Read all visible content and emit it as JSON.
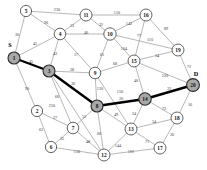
{
  "figure": {
    "kind": "weighted-undirected-graph",
    "background_color": "#ffffff",
    "edge_color": "#9a9a9a",
    "path_color": "#000000",
    "node_fill": "#ffffff",
    "node_stroke": "#3d3d3d",
    "highlight_fill": "#a8a8a8"
  },
  "terminals": [
    {
      "name": "source-marker",
      "text": "S",
      "x": 10,
      "y": 44
    },
    {
      "name": "destination-marker",
      "text": "D",
      "x": 196,
      "y": 73
    }
  ],
  "nodes": [
    {
      "id": "1",
      "label": "1",
      "x": 14,
      "y": 58,
      "r": 6.0,
      "highlighted": true
    },
    {
      "id": "2",
      "label": "2",
      "x": 37,
      "y": 111,
      "r": 5.6,
      "highlighted": false
    },
    {
      "id": "3",
      "label": "3",
      "x": 49,
      "y": 71,
      "r": 6.0,
      "highlighted": true
    },
    {
      "id": "4",
      "label": "4",
      "x": 60,
      "y": 34,
      "r": 5.8,
      "highlighted": false
    },
    {
      "id": "5",
      "label": "5",
      "x": 26,
      "y": 11,
      "r": 5.6,
      "highlighted": false
    },
    {
      "id": "6",
      "label": "6",
      "x": 51,
      "y": 147,
      "r": 5.6,
      "highlighted": false
    },
    {
      "id": "7",
      "label": "7",
      "x": 73,
      "y": 128,
      "r": 5.8,
      "highlighted": false
    },
    {
      "id": "8",
      "label": "8",
      "x": 97,
      "y": 106,
      "r": 6.0,
      "highlighted": true
    },
    {
      "id": "9",
      "label": "9",
      "x": 95,
      "y": 73,
      "r": 5.8,
      "highlighted": false
    },
    {
      "id": "10",
      "label": "10",
      "x": 110,
      "y": 34,
      "r": 6.2,
      "highlighted": false
    },
    {
      "id": "11",
      "label": "11",
      "x": 86,
      "y": 15,
      "r": 6.0,
      "highlighted": false
    },
    {
      "id": "12",
      "label": "12",
      "x": 104,
      "y": 155,
      "r": 6.0,
      "highlighted": false
    },
    {
      "id": "13",
      "label": "13",
      "x": 131,
      "y": 129,
      "r": 6.0,
      "highlighted": false
    },
    {
      "id": "14",
      "label": "14",
      "x": 145,
      "y": 99,
      "r": 6.2,
      "highlighted": true
    },
    {
      "id": "15",
      "label": "15",
      "x": 134,
      "y": 61,
      "r": 6.0,
      "highlighted": false
    },
    {
      "id": "16",
      "label": "16",
      "x": 146,
      "y": 15,
      "r": 6.0,
      "highlighted": false
    },
    {
      "id": "17",
      "label": "17",
      "x": 160,
      "y": 148,
      "r": 6.0,
      "highlighted": false
    },
    {
      "id": "18",
      "label": "18",
      "x": 177,
      "y": 118,
      "r": 6.0,
      "highlighted": false
    },
    {
      "id": "19",
      "label": "19",
      "x": 178,
      "y": 50,
      "r": 6.0,
      "highlighted": false
    },
    {
      "id": "20",
      "label": "20",
      "x": 193,
      "y": 85,
      "r": 6.4,
      "highlighted": true
    }
  ],
  "edges": [
    {
      "from": "5",
      "to": "11",
      "weight": "230",
      "lx": 57,
      "ly": 10,
      "on_path": false
    },
    {
      "from": "5",
      "to": "4",
      "weight": "90",
      "lx": 46,
      "ly": 23,
      "on_path": false
    },
    {
      "from": "5",
      "to": "1",
      "weight": "30",
      "lx": 17,
      "ly": 35,
      "on_path": false
    },
    {
      "from": "11",
      "to": "16",
      "weight": "150",
      "lx": 117,
      "ly": 13,
      "on_path": false
    },
    {
      "from": "11",
      "to": "4",
      "weight": "13",
      "lx": 72,
      "ly": 26,
      "on_path": false
    },
    {
      "from": "11",
      "to": "10",
      "weight": "32",
      "lx": 101,
      "ly": 25,
      "on_path": false
    },
    {
      "from": "4",
      "to": "10",
      "weight": "40",
      "lx": 86,
      "ly": 33,
      "on_path": false
    },
    {
      "from": "4",
      "to": "1",
      "weight": "45",
      "lx": 35,
      "ly": 44,
      "on_path": false
    },
    {
      "from": "4",
      "to": "3",
      "weight": "43",
      "lx": 55,
      "ly": 54,
      "on_path": false
    },
    {
      "from": "4",
      "to": "9",
      "weight": "17",
      "lx": 76,
      "ly": 55,
      "on_path": false
    },
    {
      "from": "10",
      "to": "16",
      "weight": "142",
      "lx": 129,
      "ly": 24,
      "on_path": false
    },
    {
      "from": "10",
      "to": "19",
      "weight": "110",
      "lx": 150,
      "ly": 40,
      "on_path": false
    },
    {
      "from": "10",
      "to": "15",
      "weight": "104",
      "lx": 124,
      "ly": 49,
      "on_path": false
    },
    {
      "from": "10",
      "to": "9",
      "weight": "61",
      "lx": 102,
      "ly": 55,
      "on_path": false
    },
    {
      "from": "16",
      "to": "19",
      "weight": "89",
      "lx": 166,
      "ly": 29,
      "on_path": false
    },
    {
      "from": "16",
      "to": "15",
      "weight": "77",
      "lx": 139,
      "ly": 36,
      "on_path": false
    },
    {
      "from": "19",
      "to": "15",
      "weight": "14",
      "lx": 157,
      "ly": 56,
      "on_path": false
    },
    {
      "from": "19",
      "to": "20",
      "weight": "72",
      "lx": 189,
      "ly": 67,
      "on_path": false
    },
    {
      "from": "15",
      "to": "9",
      "weight": "68",
      "lx": 115,
      "ly": 64,
      "on_path": false
    },
    {
      "from": "15",
      "to": "20",
      "weight": "220",
      "lx": 165,
      "ly": 76,
      "on_path": false
    },
    {
      "from": "15",
      "to": "14",
      "weight": "40",
      "lx": 136,
      "ly": 81,
      "on_path": false
    },
    {
      "from": "1",
      "to": "3",
      "weight": "45",
      "lx": 31,
      "ly": 62,
      "on_path": true
    },
    {
      "from": "1",
      "to": "2",
      "weight": "90",
      "lx": 27,
      "ly": 89,
      "on_path": false
    },
    {
      "from": "3",
      "to": "9",
      "weight": "28",
      "lx": 72,
      "ly": 70,
      "on_path": false
    },
    {
      "from": "3",
      "to": "8",
      "weight": "36",
      "lx": 73,
      "ly": 84,
      "on_path": true
    },
    {
      "from": "3",
      "to": "7",
      "weight": "60",
      "lx": 57,
      "ly": 97,
      "on_path": false
    },
    {
      "from": "3",
      "to": "12",
      "weight": "250",
      "lx": 52,
      "ly": 106,
      "on_path": false
    },
    {
      "from": "9",
      "to": "8",
      "weight": "120",
      "lx": 100,
      "ly": 89,
      "on_path": false
    },
    {
      "from": "9",
      "to": "13",
      "weight": "150",
      "lx": 120,
      "ly": 92,
      "on_path": false
    },
    {
      "from": "8",
      "to": "14",
      "weight": "20",
      "lx": 121,
      "ly": 99,
      "on_path": true
    },
    {
      "from": "8",
      "to": "7",
      "weight": "52",
      "lx": 84,
      "ly": 117,
      "on_path": false
    },
    {
      "from": "8",
      "to": "13",
      "weight": "49",
      "lx": 116,
      "ly": 115,
      "on_path": false
    },
    {
      "from": "8",
      "to": "12",
      "weight": "60",
      "lx": 99,
      "ly": 134,
      "on_path": false
    },
    {
      "from": "14",
      "to": "20",
      "weight": "22",
      "lx": 169,
      "ly": 89,
      "on_path": true
    },
    {
      "from": "14",
      "to": "13",
      "weight": "24",
      "lx": 134,
      "ly": 114,
      "on_path": false
    },
    {
      "from": "14",
      "to": "18",
      "weight": "72",
      "lx": 164,
      "ly": 109,
      "on_path": false
    },
    {
      "from": "20",
      "to": "18",
      "weight": "16",
      "lx": 190,
      "ly": 105,
      "on_path": false
    },
    {
      "from": "13",
      "to": "18",
      "weight": "54",
      "lx": 154,
      "ly": 122,
      "on_path": false
    },
    {
      "from": "13",
      "to": "17",
      "weight": "71",
      "lx": 147,
      "ly": 142,
      "on_path": false
    },
    {
      "from": "13",
      "to": "12",
      "weight": "144",
      "lx": 118,
      "ly": 146,
      "on_path": false
    },
    {
      "from": "18",
      "to": "17",
      "weight": "26",
      "lx": 172,
      "ly": 135,
      "on_path": false
    },
    {
      "from": "17",
      "to": "12",
      "weight": "101",
      "lx": 131,
      "ly": 152,
      "on_path": false
    },
    {
      "from": "7",
      "to": "2",
      "weight": "27",
      "lx": 55,
      "ly": 118,
      "on_path": false
    },
    {
      "from": "7",
      "to": "6",
      "weight": "35",
      "lx": 62,
      "ly": 139,
      "on_path": false
    },
    {
      "from": "7",
      "to": "12",
      "weight": "48",
      "lx": 88,
      "ly": 142,
      "on_path": false
    },
    {
      "from": "2",
      "to": "6",
      "weight": "62",
      "lx": 41,
      "ly": 130,
      "on_path": false
    },
    {
      "from": "6",
      "to": "12",
      "weight": "156",
      "lx": 77,
      "ly": 152,
      "on_path": false
    }
  ],
  "highlighted_path": [
    "1",
    "3",
    "8",
    "14",
    "20"
  ]
}
